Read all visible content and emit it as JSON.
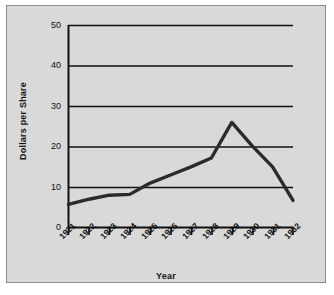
{
  "chart_data": {
    "type": "line",
    "title": "",
    "xlabel": "Year",
    "ylabel": "Dollars per Share",
    "categories": [
      "1921",
      "1922",
      "1923",
      "1924",
      "1925",
      "1926",
      "1927",
      "1928",
      "1929",
      "1930",
      "1931",
      "1932"
    ],
    "values": [
      5.7,
      7.0,
      8.0,
      8.2,
      11.0,
      13.0,
      15.0,
      17.2,
      26.0,
      20.2,
      15.0,
      6.7
    ],
    "series": [
      {
        "name": "Dollars per Share",
        "values": [
          5.7,
          7.0,
          8.0,
          8.2,
          11.0,
          13.0,
          15.0,
          17.2,
          26.0,
          20.2,
          15.0,
          6.7
        ]
      }
    ],
    "ylim": [
      0,
      50
    ],
    "yticks": [
      0,
      10,
      20,
      30,
      40,
      50
    ],
    "ytick_labels": [
      "0",
      "10",
      "20",
      "30",
      "40",
      "50"
    ],
    "grid": "horizontal",
    "legend": "none",
    "line_color": "#2b2b2b",
    "plot_background": "#d9d9d9"
  },
  "figure": {
    "background_color": "#d9d9d9",
    "border_color": "#8c8c8c",
    "axis_color": "#111111"
  }
}
